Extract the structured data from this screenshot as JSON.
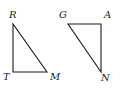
{
  "figure": {
    "stroke_color": "#1a1a1a",
    "background": "#ffffff",
    "triangles": [
      {
        "name": "RTM",
        "vertices": [
          {
            "label": "R",
            "x": 13,
            "y": 24
          },
          {
            "label": "T",
            "x": 13,
            "y": 72
          },
          {
            "label": "M",
            "x": 47,
            "y": 72
          }
        ],
        "right_angle_at": "T"
      },
      {
        "name": "GAN",
        "vertices": [
          {
            "label": "G",
            "x": 68,
            "y": 24
          },
          {
            "label": "A",
            "x": 101,
            "y": 24
          },
          {
            "label": "N",
            "x": 101,
            "y": 72
          }
        ],
        "right_angle_at": "A"
      }
    ],
    "labels": {
      "R": "R",
      "T": "T",
      "M": "M",
      "G": "G",
      "A": "A",
      "N": "N"
    }
  }
}
